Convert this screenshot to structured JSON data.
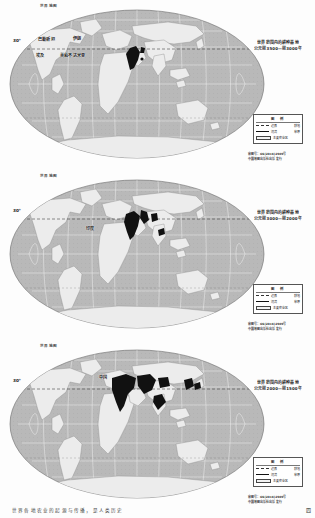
{
  "document": {
    "type": "textbook-map-figure",
    "page_footer_text": "世界各地农业的起源与传播，是人类历史",
    "page_number": "四"
  },
  "colors": {
    "ocean": "#b9b9b9",
    "land": "#ececec",
    "highlight": "#111111",
    "graticule": "#ffffff",
    "frame": "#555555",
    "text": "#1f1f1f"
  },
  "maps": [
    {
      "id": "map-1",
      "sheet_label": "世界地图",
      "title_line1": "世界范围内的耕种基地",
      "title_line2": "公元前3500—前3000年",
      "latitude_label": "30°",
      "regions": [
        {
          "name": "巴勒斯坦",
          "x": 47,
          "y": 39
        },
        {
          "name": "伊朗",
          "x": 75,
          "y": 38
        },
        {
          "name": "埃及",
          "x": 44,
          "y": 54
        },
        {
          "name": "美索不达米亚",
          "x": 66,
          "y": 54
        }
      ],
      "legend": {
        "header": "图 例",
        "rows": [
          {
            "symbol": "dashed",
            "label": "边界",
            "value": "耕地"
          },
          {
            "symbol": "solid",
            "label": "河流",
            "value": "草原"
          },
          {
            "symbol": "box",
            "label": "主要农业区",
            "value": ""
          }
        ]
      },
      "credit_line1": "审图号：GS(2016)2909号",
      "credit_line2": "中国地图出版社出版 发行"
    },
    {
      "id": "map-2",
      "sheet_label": "世界地图",
      "title_line1": "世界范围内的耕种基地",
      "title_line2": "公元前3000—前2000年",
      "latitude_label": "30°",
      "regions": [
        {
          "name": "印度",
          "x": 88,
          "y": 58
        }
      ],
      "legend": {
        "header": "图 例",
        "rows": [
          {
            "symbol": "dashed",
            "label": "边界",
            "value": "耕地"
          },
          {
            "symbol": "solid",
            "label": "河流",
            "value": "草原"
          },
          {
            "symbol": "box",
            "label": "主要农业区",
            "value": ""
          }
        ]
      },
      "credit_line1": "审图号：GS(2016)2909号",
      "credit_line2": "中国地图出版社出版 发行"
    },
    {
      "id": "map-3",
      "sheet_label": "世界地图",
      "title_line1": "世界范围内的耕种基地",
      "title_line2": "公元前2000—前1500年",
      "latitude_label": "30°",
      "regions": [
        {
          "name": "中国",
          "x": 101,
          "y": 37
        }
      ],
      "legend": {
        "header": "图 例",
        "rows": [
          {
            "symbol": "dashed",
            "label": "边界",
            "value": "耕地"
          },
          {
            "symbol": "solid",
            "label": "河流",
            "value": "草原"
          },
          {
            "symbol": "box",
            "label": "主要农业区",
            "value": ""
          }
        ]
      },
      "credit_line1": "审图号：GS(2016)2909号",
      "credit_line2": "中国地图出版社出版 发行"
    }
  ]
}
